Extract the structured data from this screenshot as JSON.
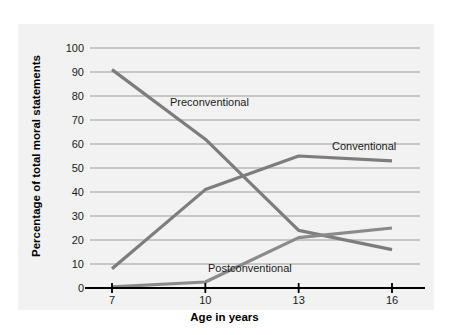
{
  "chart_data": {
    "type": "line",
    "title": "",
    "xlabel": "Age in years",
    "ylabel": "Percentage of total moral statements",
    "x": [
      7,
      10,
      13,
      16
    ],
    "xticklabels": [
      "7",
      "10",
      "13",
      "16"
    ],
    "yticklabels": [
      "0",
      "10",
      "20",
      "30",
      "40",
      "50",
      "60",
      "70",
      "80",
      "90",
      "100"
    ],
    "yticks": [
      0,
      10,
      20,
      30,
      40,
      50,
      60,
      70,
      80,
      90,
      100
    ],
    "ylim": [
      0,
      100
    ],
    "xlim": [
      7,
      16
    ],
    "grid": "horizontal",
    "legend": "inline-annotations",
    "series": [
      {
        "name": "Preconventional",
        "values": [
          91,
          62,
          24,
          16
        ],
        "color": "#7d7d7d"
      },
      {
        "name": "Conventional",
        "values": [
          8,
          41,
          55,
          53
        ],
        "color": "#7d7d7d"
      },
      {
        "name": "Postconventional",
        "values": [
          0.5,
          2.5,
          21,
          25
        ],
        "color": "#8a8a8a"
      }
    ],
    "annotations": [
      {
        "text": "Preconventional",
        "series": "Preconventional"
      },
      {
        "text": "Conventional",
        "series": "Conventional"
      },
      {
        "text": "Postconventional",
        "series": "Postconventional"
      }
    ],
    "colors": {
      "panel_background": "#f2f2f2",
      "gridline": "#b8b8b8",
      "axis": "#000000",
      "line": "#7d7d7d",
      "text": "#1a1a1a"
    }
  }
}
